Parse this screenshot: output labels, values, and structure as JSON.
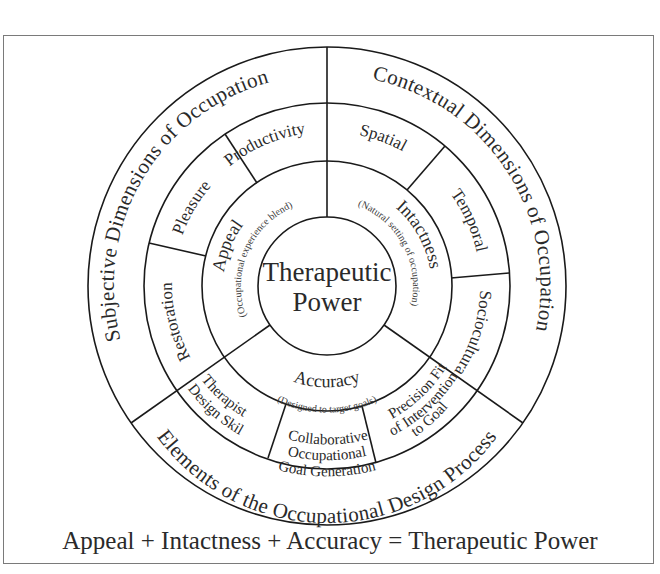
{
  "diagram": {
    "center": {
      "line1": "Therapeutic",
      "line2": "Power"
    },
    "inner_ring": [
      {
        "label": "Appeal",
        "subtitle": "(Occupational experience blend)"
      },
      {
        "label": "Intactness",
        "subtitle": "(Natural setting of occupation)"
      },
      {
        "label": "Accuracy",
        "subtitle": "(Designed to target goals)"
      }
    ],
    "middle_ring": {
      "appeal_sector": [
        "Productivity",
        "Pleasure",
        "Restoration"
      ],
      "intactness_sector": [
        "Spatial",
        "Temporal",
        "Sociocultural"
      ],
      "accuracy_sector": [
        {
          "lines": [
            "Therapist",
            "Design Skill"
          ]
        },
        {
          "lines": [
            "Collaborative",
            "Occupational",
            "Goal Generation"
          ]
        },
        {
          "lines": [
            "Precision Fit",
            "of Intervention",
            "to Goal"
          ]
        }
      ]
    },
    "outer_ring": {
      "left": "Subjective Dimensions of Occupation",
      "right": "Contextual Dimensions of Occupation",
      "bottom": "Elements of the Occupational Design Process"
    },
    "equation": "Appeal + Intactness + Accuracy = Therapeutic Power",
    "colors": {
      "line": "#1a1a1a",
      "text": "#2a2a2a",
      "frame": "#7a7a7a",
      "background": "#ffffff"
    }
  }
}
